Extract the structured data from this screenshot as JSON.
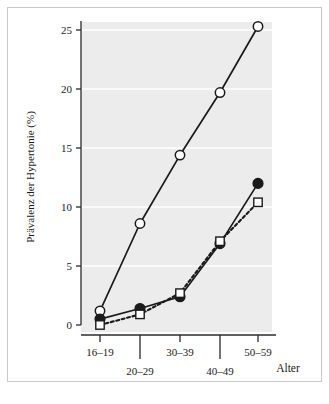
{
  "figure": {
    "background_color": "#ffffff",
    "border_color": "#c9c9c9",
    "plot_background_color": "#ececec",
    "gridline_color": "#ffffff",
    "axis_color": "#2b2b2b"
  },
  "chart_data": {
    "type": "line",
    "title": "",
    "subtitle": "",
    "xlabel": "Alter",
    "ylabel": "Prävalenz der Hypertonie (%)",
    "categories": [
      "16–19",
      "20–29",
      "30–39",
      "40–49",
      "50–59"
    ],
    "xtick_labels": [
      "16–19",
      "20–29",
      "30–39",
      "40–49",
      "50–59"
    ],
    "ytick_labels": [
      "0",
      "5",
      "10",
      "15",
      "20",
      "25"
    ],
    "ytick_values": [
      0,
      5,
      10,
      15,
      20,
      25
    ],
    "ylim": [
      0,
      26.5
    ],
    "grid": true,
    "grid_axis": "y",
    "legend": "none",
    "series": [
      {
        "name": "open-circle-series",
        "marker": "open-circle",
        "line_style": "solid",
        "color": "#1a1a1a",
        "fill": "#ffffff",
        "values": [
          1.2,
          8.6,
          14.4,
          19.7,
          25.3
        ]
      },
      {
        "name": "filled-circle-series",
        "marker": "filled-circle",
        "line_style": "solid",
        "color": "#1a1a1a",
        "fill": "#1a1a1a",
        "values": [
          0.5,
          1.4,
          2.4,
          6.9,
          12.0
        ]
      },
      {
        "name": "open-square-series",
        "marker": "open-square",
        "line_style": "dashed",
        "color": "#1a1a1a",
        "fill": "#ffffff",
        "values": [
          0.0,
          0.9,
          2.7,
          7.1,
          10.4
        ]
      }
    ]
  }
}
